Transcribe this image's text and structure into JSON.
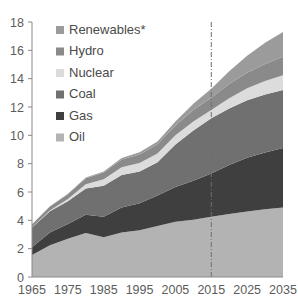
{
  "chart_data": {
    "type": "area",
    "stacked": true,
    "title": "",
    "subtitle": "",
    "xlabel": "",
    "ylabel": "",
    "xlim": [
      1965,
      2035
    ],
    "ylim": [
      0,
      18
    ],
    "ytick_step": 2,
    "xtick_step": 10,
    "grid": false,
    "legend_position": "inside-top-left",
    "x": [
      1965,
      1970,
      1975,
      1980,
      1985,
      1990,
      1995,
      2000,
      2005,
      2010,
      2015,
      2020,
      2025,
      2030,
      2035
    ],
    "xticks": [
      "1965",
      "1975",
      "1985",
      "1995",
      "2005",
      "2015",
      "2025",
      "2035"
    ],
    "yticks": [
      "0",
      "2",
      "4",
      "6",
      "8",
      "10",
      "12",
      "14",
      "16",
      "18"
    ],
    "annotations": [
      {
        "name": "projection-divider",
        "type": "vline",
        "x": 2015,
        "style": "dash-dot"
      }
    ],
    "footnote_marker": "*",
    "series": [
      {
        "name": "Oil",
        "color": "#b3b3b3",
        "values": [
          1.55,
          2.25,
          2.7,
          3.1,
          2.8,
          3.15,
          3.3,
          3.6,
          3.9,
          4.05,
          4.25,
          4.45,
          4.62,
          4.78,
          4.9
        ]
      },
      {
        "name": "Gas",
        "color": "#3f3f3f",
        "values": [
          0.55,
          0.9,
          1.05,
          1.3,
          1.45,
          1.75,
          1.9,
          2.15,
          2.45,
          2.75,
          3.05,
          3.45,
          3.8,
          4.0,
          4.2
        ]
      },
      {
        "name": "Coal",
        "color": "#707070",
        "values": [
          1.4,
          1.5,
          1.6,
          1.85,
          2.2,
          2.3,
          2.25,
          2.35,
          3.0,
          3.55,
          3.9,
          4.0,
          4.05,
          4.1,
          4.1
        ]
      },
      {
        "name": "Nuclear",
        "color": "#dcdcdc",
        "values": [
          0.01,
          0.05,
          0.15,
          0.3,
          0.45,
          0.55,
          0.6,
          0.62,
          0.65,
          0.63,
          0.58,
          0.72,
          0.85,
          0.95,
          1.05
        ]
      },
      {
        "name": "Hydro",
        "color": "#8a8a8a",
        "values": [
          0.2,
          0.28,
          0.35,
          0.42,
          0.48,
          0.55,
          0.6,
          0.65,
          0.7,
          0.8,
          0.88,
          1.0,
          1.1,
          1.2,
          1.3
        ]
      },
      {
        "name": "Renewables*",
        "color": "#9b9b9b",
        "values": [
          0.01,
          0.02,
          0.03,
          0.05,
          0.07,
          0.1,
          0.15,
          0.2,
          0.28,
          0.45,
          0.62,
          0.9,
          1.2,
          1.5,
          1.75
        ]
      }
    ],
    "legend": [
      {
        "label": "Renewables*",
        "color": "#9b9b9b",
        "swatch": "legend-swatch-renewables"
      },
      {
        "label": "Hydro",
        "color": "#8a8a8a",
        "swatch": "legend-swatch-hydro"
      },
      {
        "label": "Nuclear",
        "color": "#dcdcdc",
        "swatch": "legend-swatch-nuclear"
      },
      {
        "label": "Coal",
        "color": "#707070",
        "swatch": "legend-swatch-coal"
      },
      {
        "label": "Gas",
        "color": "#3f3f3f",
        "swatch": "legend-swatch-gas"
      },
      {
        "label": "Oil",
        "color": "#b3b3b3",
        "swatch": "legend-swatch-oil"
      }
    ]
  },
  "axes": {
    "plot_left": 32,
    "plot_right": 283,
    "plot_top": 22,
    "plot_bottom": 277
  }
}
